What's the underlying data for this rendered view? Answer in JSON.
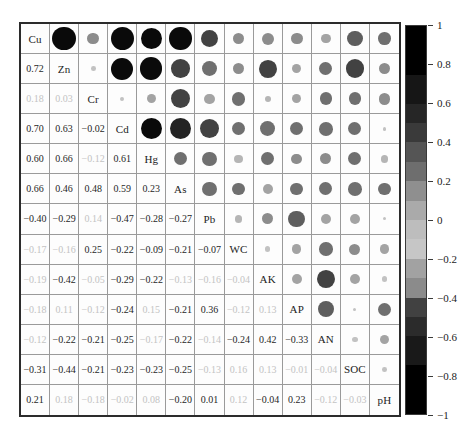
{
  "chart_data": {
    "type": "heatmap",
    "subtype": "correlation-matrix",
    "description_visible": "",
    "variables": [
      "Cu",
      "Zn",
      "Cr",
      "Cd",
      "Hg",
      "As",
      "Pb",
      "WC",
      "AK",
      "AP",
      "AN",
      "SOC",
      "pH"
    ],
    "lower_triangle_values": [
      [
        "0.72"
      ],
      [
        "0.18",
        "0.03"
      ],
      [
        "0.70",
        "0.63",
        "-0.02"
      ],
      [
        "0.60",
        "0.66",
        "-0.12",
        "0.61"
      ],
      [
        "0.66",
        "0.46",
        "0.48",
        "0.59",
        "0.23"
      ],
      [
        "-0.40",
        "-0.29",
        "0.14",
        "-0.47",
        "-0.28",
        "-0.27"
      ],
      [
        "-0.17",
        "-0.16",
        "0.25",
        "-0.22",
        "-0.09",
        "-0.21",
        "-0.07"
      ],
      [
        "-0.19",
        "-0.42",
        "-0.05",
        "-0.29",
        "-0.22",
        "-0.13",
        "-0.16",
        "-0.04"
      ],
      [
        "-0.18",
        "0.11",
        "-0.12",
        "-0.24",
        "0.15",
        "-0.21",
        "0.36",
        "-0.12",
        "0.13"
      ],
      [
        "-0.12",
        "-0.22",
        "-0.21",
        "-0.25",
        "-0.17",
        "-0.22",
        "-0.14",
        "-0.24",
        "0.42",
        "-0.33"
      ],
      [
        "-0.31",
        "-0.44",
        "-0.21",
        "-0.23",
        "-0.23",
        "-0.25",
        "-0.13",
        "0.16",
        "0.13",
        "-0.01",
        "-0.04"
      ],
      [
        "0.21",
        "0.18",
        "-0.18",
        "-0.02",
        "0.08",
        "-0.20",
        "0.01",
        "0.12",
        "-0.04",
        "0.23",
        "-0.12",
        "-0.03"
      ]
    ],
    "lower_triangle_light_text": [
      [
        false
      ],
      [
        true,
        true
      ],
      [
        false,
        false,
        false
      ],
      [
        false,
        false,
        true,
        false
      ],
      [
        false,
        false,
        false,
        false,
        false
      ],
      [
        false,
        false,
        true,
        false,
        false,
        false
      ],
      [
        true,
        true,
        false,
        false,
        false,
        false,
        false
      ],
      [
        true,
        false,
        true,
        false,
        false,
        true,
        true,
        true
      ],
      [
        true,
        true,
        true,
        false,
        true,
        false,
        false,
        true,
        true
      ],
      [
        true,
        false,
        false,
        false,
        true,
        false,
        true,
        false,
        false,
        false
      ],
      [
        false,
        false,
        false,
        false,
        false,
        false,
        true,
        true,
        true,
        true,
        true
      ],
      [
        false,
        true,
        true,
        true,
        true,
        false,
        false,
        true,
        false,
        false,
        true,
        true
      ]
    ],
    "upper_triangle_encoding": "circle area proportional to |r|, gray level from colorbar",
    "circle_bands": [
      {
        "min": 0.6,
        "color": "#0a0a0a"
      },
      {
        "min": 0.5,
        "color": "#232323"
      },
      {
        "min": 0.4,
        "color": "#424242"
      },
      {
        "min": 0.3,
        "color": "#5e5e5e"
      },
      {
        "min": 0.2,
        "color": "#6f6f6f"
      },
      {
        "min": 0.15,
        "color": "#8c8c8c"
      },
      {
        "min": 0.1,
        "color": "#a3a3a3"
      },
      {
        "min": 0.05,
        "color": "#b5b5b5"
      },
      {
        "min": 0,
        "color": "#c2c2c2"
      }
    ],
    "colorbar": {
      "range": [
        -1,
        1
      ],
      "tick_labels": [
        "1",
        "0.8",
        "0.6",
        "0.4",
        "0.2",
        "0",
        "−0.2",
        "−0.4",
        "−0.6",
        "−0.8",
        "−1"
      ],
      "bands_top_to_bottom": [
        {
          "from": 1.0,
          "to": 0.75,
          "color": "#000000"
        },
        {
          "from": 0.75,
          "to": 0.6,
          "color": "#161616"
        },
        {
          "from": 0.6,
          "to": 0.5,
          "color": "#262626"
        },
        {
          "from": 0.5,
          "to": 0.4,
          "color": "#3a3a3a"
        },
        {
          "from": 0.4,
          "to": 0.3,
          "color": "#555555"
        },
        {
          "from": 0.3,
          "to": 0.2,
          "color": "#6e6e6e"
        },
        {
          "from": 0.2,
          "to": 0.1,
          "color": "#8f8f8f"
        },
        {
          "from": 0.1,
          "to": 0.0,
          "color": "#aaaaaa"
        },
        {
          "from": 0.0,
          "to": -0.1,
          "color": "#bdbdbd"
        },
        {
          "from": -0.1,
          "to": -0.2,
          "color": "#c6c6c6"
        },
        {
          "from": -0.2,
          "to": -0.3,
          "color": "#a2a2a2"
        },
        {
          "from": -0.3,
          "to": -0.4,
          "color": "#8b8b8b"
        },
        {
          "from": -0.4,
          "to": -0.5,
          "color": "#414141"
        },
        {
          "from": -0.5,
          "to": -0.6,
          "color": "#2b2b2b"
        },
        {
          "from": -0.6,
          "to": -0.75,
          "color": "#191919"
        },
        {
          "from": -0.75,
          "to": -1.0,
          "color": "#000000"
        }
      ]
    },
    "colors": {
      "text_dark": "#1f1f1f",
      "text_light": "#c3c3c3",
      "grid_line": "#9a9a9a",
      "outer_border": "#2b2b2b",
      "background": "#ffffff"
    }
  }
}
